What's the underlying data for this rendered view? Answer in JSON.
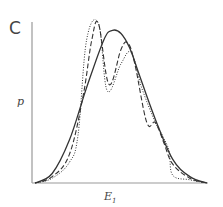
{
  "figure": {
    "panel_label": "C",
    "ylabel": "p",
    "xlabel_main": "E",
    "xlabel_sub": "1"
  },
  "chart_data": {
    "type": "line",
    "title": "",
    "panel": "C",
    "xlabel": "E1",
    "ylabel": "p",
    "grid": false,
    "legend": null,
    "x_ticks": [],
    "y_ticks": [],
    "xlim": [
      0,
      1
    ],
    "ylim": [
      0,
      1
    ],
    "series": [
      {
        "name": "solid (smooth Gaussian)",
        "style": "solid",
        "color": "#333333",
        "x": [
          0.0,
          0.1,
          0.2,
          0.3,
          0.4,
          0.45,
          0.5,
          0.55,
          0.6,
          0.7,
          0.8,
          0.9,
          1.0
        ],
        "y": [
          0.0,
          0.06,
          0.27,
          0.6,
          0.9,
          0.96,
          0.94,
          0.85,
          0.7,
          0.4,
          0.15,
          0.04,
          0.0
        ]
      },
      {
        "name": "dashed (bimodal)",
        "style": "dashed",
        "color": "#333333",
        "x": [
          0.0,
          0.1,
          0.2,
          0.28,
          0.33,
          0.37,
          0.43,
          0.5,
          0.54,
          0.58,
          0.65,
          0.7,
          0.75,
          0.8,
          0.9,
          1.0
        ],
        "y": [
          0.0,
          0.04,
          0.18,
          0.55,
          0.9,
          1.0,
          0.62,
          0.84,
          0.88,
          0.75,
          0.38,
          0.38,
          0.25,
          0.12,
          0.03,
          0.0
        ]
      },
      {
        "name": "dotted (stepwise bimodal)",
        "style": "dotted",
        "color": "#333333",
        "x": [
          0.0,
          0.1,
          0.2,
          0.25,
          0.3,
          0.37,
          0.42,
          0.5,
          0.56,
          0.62,
          0.7,
          0.74,
          0.78,
          0.8,
          0.9,
          1.0
        ],
        "y": [
          0.0,
          0.03,
          0.13,
          0.3,
          0.9,
          1.0,
          0.58,
          0.75,
          0.82,
          0.6,
          0.38,
          0.3,
          0.2,
          0.05,
          0.02,
          0.0
        ]
      }
    ]
  }
}
